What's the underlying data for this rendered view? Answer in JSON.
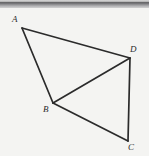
{
  "figure": {
    "background_color": "#f4f4f2",
    "stroke_color": "#2b2b2b",
    "label_color": "#2b2b2b",
    "top_bar": {
      "name": "gray-gradient-bar",
      "height_px": 8,
      "colors": [
        "#d9d9d9",
        "#58585a",
        "#d2d2d2"
      ]
    },
    "vertices": [
      {
        "id": "A",
        "label": "A",
        "x": 22,
        "y": 28,
        "label_x": 12,
        "label_y": 15
      },
      {
        "id": "B",
        "label": "B",
        "x": 53,
        "y": 103,
        "label_x": 43,
        "label_y": 105
      },
      {
        "id": "C",
        "label": "C",
        "x": 128,
        "y": 141,
        "label_x": 128,
        "label_y": 143
      },
      {
        "id": "D",
        "label": "D",
        "x": 130,
        "y": 58,
        "label_x": 130,
        "label_y": 45
      }
    ],
    "segments": [
      {
        "name": "segment-AD",
        "from": "A",
        "to": "D"
      },
      {
        "name": "segment-AB",
        "from": "A",
        "to": "B"
      },
      {
        "name": "segment-BD",
        "from": "B",
        "to": "D"
      },
      {
        "name": "segment-BC",
        "from": "B",
        "to": "C"
      },
      {
        "name": "segment-DC",
        "from": "D",
        "to": "C"
      }
    ],
    "polyline_points": "22,28 130,58 53,103 22,28",
    "polyline_points_2": "53,103 128,141 130,58"
  }
}
